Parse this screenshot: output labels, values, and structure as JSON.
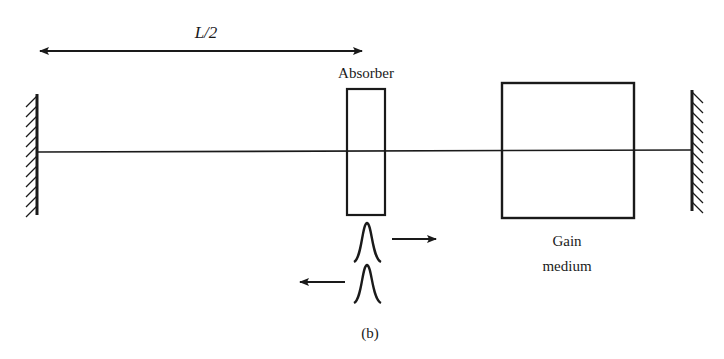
{
  "diagram": {
    "distance_label": "L/2",
    "absorber_label": "Absorber",
    "gain_label_line1": "Gain",
    "gain_label_line2": "medium",
    "panel_label": "(b)",
    "colors": {
      "ink": "#1a1a1a",
      "background": "#ffffff"
    },
    "elements": {
      "left_mirror": "mirror-icon",
      "right_mirror": "mirror-icon",
      "pulse_forward": "pulse-icon",
      "pulse_backward": "pulse-icon"
    }
  }
}
